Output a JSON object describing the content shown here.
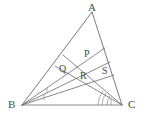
{
  "figure": {
    "type": "geometry-diagram",
    "width": 148,
    "height": 123,
    "background_color": "#ffffff",
    "stroke_color": "#6b6b6b",
    "base_stroke_color": "#8a8a8a",
    "label_color": "#4a4a4a",
    "stroke_width": 0.9
  },
  "vertices": [
    {
      "name": "A",
      "label": "A",
      "x": 92,
      "y": 12,
      "label_x": 88,
      "label_y": 2,
      "role": "apex"
    },
    {
      "name": "B",
      "label": "B",
      "x": 22,
      "y": 105,
      "label_x": 8,
      "label_y": 99,
      "role": "base-left"
    },
    {
      "name": "C",
      "label": "C",
      "x": 122,
      "y": 105,
      "label_x": 128,
      "label_y": 99,
      "role": "base-right"
    }
  ],
  "interior_points": [
    {
      "name": "P",
      "label": "P",
      "x": 89,
      "y": 61,
      "label_x": 84,
      "label_y": 49
    },
    {
      "name": "Q",
      "label": "Q",
      "x": 66,
      "y": 77,
      "label_x": 59,
      "label_y": 64
    },
    {
      "name": "R",
      "label": "R",
      "x": 86,
      "y": 82,
      "label_x": 80,
      "label_y": 71
    },
    {
      "name": "S",
      "label": "S",
      "x": 105,
      "y": 78,
      "label_x": 102,
      "label_y": 66
    }
  ],
  "side_points": [
    {
      "name": "F1",
      "on_side": "AB",
      "x": 63,
      "y": 55
    },
    {
      "name": "F2",
      "on_side": "AB",
      "x": 55,
      "y": 66
    },
    {
      "name": "E1",
      "on_side": "AC",
      "x": 105,
      "y": 48
    },
    {
      "name": "E2",
      "on_side": "AC",
      "x": 110,
      "y": 62
    },
    {
      "name": "E3",
      "on_side": "AC",
      "x": 114,
      "y": 75
    }
  ],
  "segments": [
    {
      "name": "side-AB",
      "from": "A",
      "to": "B",
      "kind": "triangle-side"
    },
    {
      "name": "side-AC",
      "from": "A",
      "to": "C",
      "kind": "triangle-side"
    },
    {
      "name": "side-BC",
      "from": "B",
      "to": "C",
      "kind": "triangle-base"
    },
    {
      "name": "cevian-B-E1",
      "from": "B",
      "to": "E1",
      "kind": "cevian-from-B"
    },
    {
      "name": "cevian-B-E2",
      "from": "B",
      "to": "E2",
      "kind": "cevian-from-B"
    },
    {
      "name": "cevian-B-E3",
      "from": "B",
      "to": "E3",
      "kind": "cevian-from-B"
    },
    {
      "name": "cevian-C-F1",
      "from": "C",
      "to": "F1",
      "kind": "cevian-from-C"
    },
    {
      "name": "cevian-C-F2",
      "from": "C",
      "to": "F2",
      "kind": "cevian-from-C"
    }
  ],
  "angle_marks": [
    {
      "name": "angle-mark-B-1",
      "at_vertex": "B",
      "style": "tick"
    },
    {
      "name": "angle-mark-B-2",
      "at_vertex": "B",
      "style": "tick"
    },
    {
      "name": "angle-mark-C-1",
      "at_vertex": "C",
      "style": "arc"
    },
    {
      "name": "angle-mark-C-2",
      "at_vertex": "C",
      "style": "arc"
    },
    {
      "name": "angle-mark-C-3",
      "at_vertex": "C",
      "style": "arc"
    }
  ]
}
